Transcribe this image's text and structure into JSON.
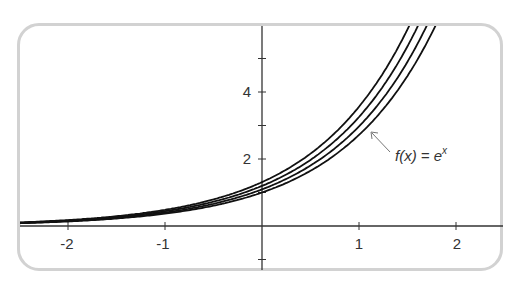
{
  "chart_data": {
    "type": "line",
    "title": "",
    "xlabel": "",
    "ylabel": "",
    "xlim": [
      -2.5,
      2.5
    ],
    "ylim": [
      -1.2,
      6
    ],
    "grid": false,
    "x_ticks": [
      -2,
      -1,
      1,
      2
    ],
    "x_tick_labels": [
      "-2",
      "-1",
      "1",
      "2"
    ],
    "y_ticks": [
      -1,
      1,
      2,
      3,
      4,
      5
    ],
    "y_tick_labels": {
      "2": "2",
      "4": "4"
    },
    "series": [
      {
        "name": "f(x) = e^x",
        "formula": "e^x",
        "shift": 0.0,
        "y_at_0": 1.0
      },
      {
        "name": "curve 2",
        "formula": "e^(x+0.09)",
        "shift": 0.09,
        "y_at_0": 1.09
      },
      {
        "name": "curve 3",
        "formula": "e^(x+0.18)",
        "shift": 0.18,
        "y_at_0": 1.2
      },
      {
        "name": "curve 4",
        "formula": "e^(x+0.27)",
        "shift": 0.27,
        "y_at_0": 1.31
      }
    ],
    "annotations": [
      {
        "text": "f(x) = e^x",
        "points_to": "f(x) = e^x",
        "at_x": 1.1
      }
    ],
    "colors": {
      "curves": "#111111",
      "axes": "#333333",
      "frame": "#d2d2d2"
    }
  },
  "labels": {
    "x": [
      "-2",
      "-1",
      "1",
      "2"
    ],
    "y": [
      "4",
      "2"
    ],
    "fn_main": "f(x) = e",
    "fn_exp": "x"
  }
}
